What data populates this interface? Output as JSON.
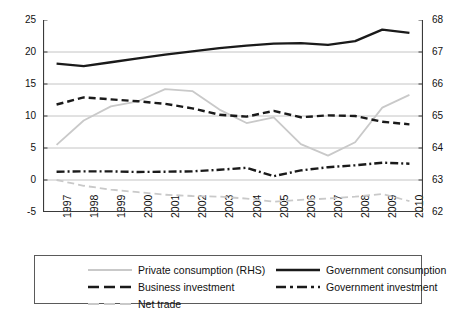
{
  "chart_data": {
    "type": "line",
    "title": "",
    "xlabel": "",
    "ylabel": "",
    "categories": [
      "1997",
      "1998",
      "1999",
      "2000",
      "2001",
      "2002",
      "2003",
      "2004",
      "2005",
      "2006",
      "2007",
      "2008",
      "2009",
      "2010"
    ],
    "x": [
      1997,
      1998,
      1999,
      2000,
      2001,
      2002,
      2003,
      2004,
      2005,
      2006,
      2007,
      2008,
      2009,
      2010
    ],
    "ylim": [
      -5,
      25
    ],
    "yticks": [
      "-5",
      "0",
      "5",
      "10",
      "15",
      "20",
      "25"
    ],
    "y2lim": [
      62,
      68
    ],
    "y2ticks": [
      "62",
      "63",
      "64",
      "65",
      "66",
      "67",
      "68"
    ],
    "grid": true,
    "legend_position": "bottom",
    "series": [
      {
        "name": "Private consumption (RHS)",
        "axis": "right",
        "style": "solid",
        "color": "#c9c9c9",
        "values_right_axis": [
          64.1,
          64.85,
          65.3,
          65.6,
          65.9,
          65.85,
          65.15,
          64.9,
          65.0,
          64.15,
          63.75,
          64.2,
          65.25,
          65.7
        ],
        "values_left_scale": [
          5.5,
          9.3,
          11.5,
          12.3,
          14.2,
          13.9,
          11.0,
          8.9,
          9.8,
          5.6,
          3.8,
          5.9,
          11.3,
          13.3
        ]
      },
      {
        "name": "Government consumption",
        "axis": "left",
        "style": "solid",
        "color": "#1a1a1a",
        "values": [
          18.2,
          17.8,
          18.4,
          19.0,
          19.6,
          20.1,
          20.6,
          21.0,
          21.3,
          21.4,
          21.1,
          21.7,
          23.5,
          23.0
        ]
      },
      {
        "name": "Business investment",
        "axis": "left",
        "style": "dashed",
        "color": "#1a1a1a",
        "values": [
          11.8,
          12.9,
          12.6,
          12.3,
          11.9,
          11.2,
          10.2,
          9.9,
          10.8,
          9.8,
          10.1,
          10.0,
          9.1,
          8.7
        ]
      },
      {
        "name": "Government investment",
        "axis": "left",
        "style": "dashdot",
        "color": "#1a1a1a",
        "values": [
          1.3,
          1.35,
          1.35,
          1.25,
          1.3,
          1.35,
          1.6,
          1.9,
          0.6,
          1.5,
          2.0,
          2.3,
          2.7,
          2.55
        ]
      },
      {
        "name": "Net trade",
        "axis": "left",
        "style": "dashed",
        "color": "#c9c9c9",
        "values": [
          0.0,
          -0.9,
          -1.5,
          -1.9,
          -2.3,
          -2.5,
          -2.6,
          -2.9,
          -3.4,
          -3.1,
          -2.9,
          -2.6,
          -2.2,
          -3.3
        ]
      }
    ]
  },
  "legend": {
    "items": [
      {
        "label": "Private consumption (RHS)",
        "style": "solid",
        "color": "#c9c9c9"
      },
      {
        "label": "Government consumption",
        "style": "solid",
        "color": "#1a1a1a"
      },
      {
        "label": "Business investment",
        "style": "dashed",
        "color": "#1a1a1a"
      },
      {
        "label": "Government investment",
        "style": "dashdot",
        "color": "#1a1a1a"
      },
      {
        "label": "Net trade",
        "style": "dashed",
        "color": "#c9c9c9"
      }
    ]
  }
}
